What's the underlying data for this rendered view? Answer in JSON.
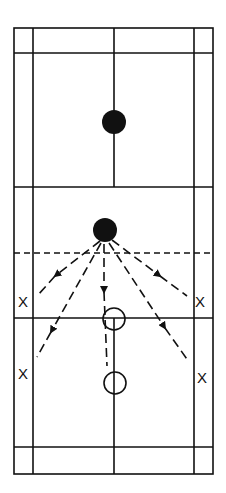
{
  "diagram": {
    "colors": {
      "line": "#111111",
      "background": "#ffffff"
    },
    "court": {
      "outer": {
        "x1": 14,
        "y1": 28,
        "x2": 213,
        "y2": 474
      },
      "singles_sidelines_x": [
        33,
        194
      ],
      "center_x": 114,
      "horizontal_lines_y": [
        53,
        187,
        318,
        447
      ],
      "center_line_segments": [
        [
          28,
          187
        ],
        [
          318,
          474
        ]
      ],
      "net_y": 253
    },
    "players": [
      {
        "type": "filled",
        "x": 114,
        "y": 122,
        "r": 12
      },
      {
        "type": "filled",
        "x": 105,
        "y": 230,
        "r": 12
      },
      {
        "type": "hollow",
        "x": 114,
        "y": 319,
        "r": 11
      },
      {
        "type": "hollow",
        "x": 115,
        "y": 383,
        "r": 11
      }
    ],
    "arrows": [
      {
        "from": [
          100,
          241
        ],
        "head": [
          55,
          276
        ],
        "tail_end": [
          38,
          295
        ]
      },
      {
        "from": [
          101,
          243
        ],
        "head": [
          51,
          332
        ],
        "tail_end": [
          37,
          357
        ]
      },
      {
        "from": [
          104,
          244
        ],
        "head": [
          104,
          292
        ],
        "tail_end": [
          107,
          366
        ]
      },
      {
        "from": [
          109,
          243
        ],
        "head": [
          165,
          328
        ],
        "tail_end": [
          189,
          362
        ]
      },
      {
        "from": [
          112,
          240
        ],
        "head": [
          160,
          276
        ],
        "tail_end": [
          187,
          296
        ]
      }
    ],
    "markers": [
      {
        "text": "X",
        "x": 24,
        "y": 302
      },
      {
        "text": "X",
        "x": 201,
        "y": 302
      },
      {
        "text": "X",
        "x": 24,
        "y": 374
      },
      {
        "text": "X",
        "x": 203,
        "y": 378
      }
    ]
  }
}
